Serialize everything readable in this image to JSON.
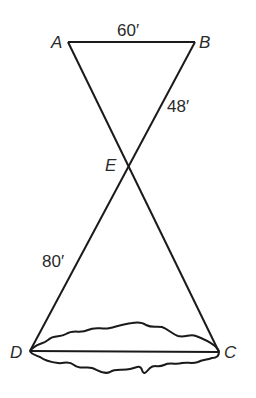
{
  "diagram": {
    "type": "intersecting-triangles-across-river",
    "points": {
      "A": {
        "label": "A",
        "x": 68,
        "y": 42
      },
      "B": {
        "label": "B",
        "x": 195,
        "y": 42
      },
      "E": {
        "label": "E",
        "x": 126,
        "y": 164
      },
      "D": {
        "label": "D",
        "x": 30,
        "y": 351
      },
      "C": {
        "label": "C",
        "x": 219,
        "y": 352
      }
    },
    "segments": [
      {
        "from": "A",
        "to": "B"
      },
      {
        "from": "A",
        "to": "C"
      },
      {
        "from": "B",
        "to": "D"
      },
      {
        "from": "D",
        "to": "C"
      }
    ],
    "measurements": {
      "AB": "60′",
      "BE": "48′",
      "DE": "80′"
    },
    "obstacle": "river-outline",
    "stroke_color": "#1a1a1a"
  }
}
